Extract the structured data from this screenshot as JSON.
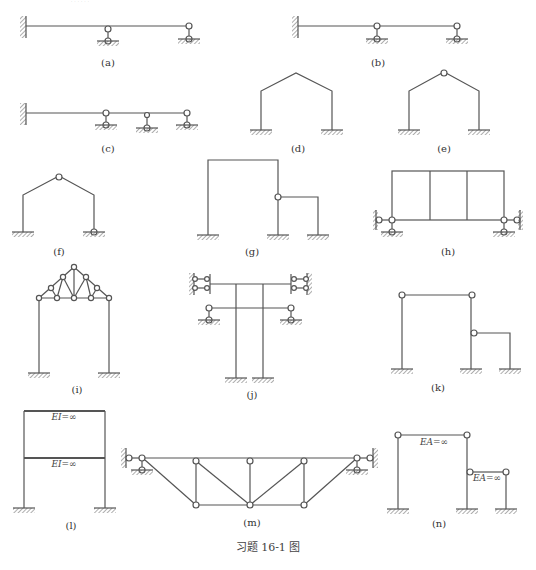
{
  "header": {
    "cropped_text": "……"
  },
  "caption": "习题 16-1 图",
  "colors": {
    "line": "#555555",
    "hatch": "#777777",
    "hinge_fill": "#ffffff"
  },
  "diagrams": [
    {
      "id": "a",
      "label": "(a)",
      "type": "continuous-beam",
      "description": "Beam fixed at left wall, hinge on beam at middle support and roller support at right end"
    },
    {
      "id": "b",
      "label": "(b)",
      "type": "continuous-beam",
      "description": "Beam fixed at left wall with hinged intermediate support and right end support"
    },
    {
      "id": "c",
      "label": "(c)",
      "type": "continuous-beam",
      "description": "Beam fixed at left wall with three link supports"
    },
    {
      "id": "d",
      "label": "(d)",
      "type": "gable-frame",
      "description": "Gable frame with fixed bases, no hinge"
    },
    {
      "id": "e",
      "label": "(e)",
      "type": "gable-frame",
      "description": "Gable frame with fixed bases and apex hinge"
    },
    {
      "id": "f",
      "label": "(f)",
      "type": "gable-frame",
      "description": "Gable frame with apex hinge, left fixed base, right hinged base"
    },
    {
      "id": "g",
      "label": "(g)",
      "type": "portal-frame",
      "description": "Portal frame with hinged side frame attached to right column"
    },
    {
      "id": "h",
      "label": "(h)",
      "type": "multi-bay-frame",
      "description": "Three-bay frame on hinged supports with lateral links"
    },
    {
      "id": "i",
      "label": "(i)",
      "type": "truss-frame",
      "description": "Portal frame with truss roof"
    },
    {
      "id": "j",
      "label": "(j)",
      "type": "bent",
      "description": "Two-column bent with top beam laterally restrained and lower crossbeam on link supports"
    },
    {
      "id": "k",
      "label": "(k)",
      "type": "portal-frame",
      "description": "Frame with hinged top beam and hinged side frame"
    },
    {
      "id": "l",
      "label": "(l)",
      "type": "two-story-frame",
      "description": "Two-story frame with rigid beams",
      "annotations": [
        "EI=∞",
        "EI=∞"
      ]
    },
    {
      "id": "m",
      "label": "(m)",
      "type": "truss",
      "description": "Trapezoidal truss with hinged end supports and lateral links"
    },
    {
      "id": "n",
      "label": "(n)",
      "type": "bent",
      "description": "Bent with rigid links",
      "annotations": [
        "EA=∞",
        "EA=∞"
      ]
    }
  ]
}
